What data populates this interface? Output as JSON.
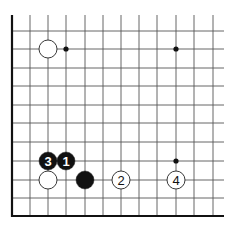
{
  "diagram": {
    "type": "go-board-fragment",
    "grid": {
      "columns_x": [
        12,
        30,
        48,
        66,
        85,
        103,
        121,
        139,
        157,
        176,
        194,
        213
      ],
      "rows_y": [
        31,
        49,
        68,
        86,
        105,
        123,
        142,
        161,
        180,
        198,
        216
      ],
      "top_y": 15,
      "right_x": 224,
      "left_edge_x": 12,
      "bottom_edge_y": 216,
      "line_color": "#555555",
      "edge_color": "#111111"
    },
    "star_points": [
      {
        "x": 66,
        "y": 49
      },
      {
        "x": 176,
        "y": 49
      },
      {
        "x": 176,
        "y": 161
      }
    ],
    "stones": [
      {
        "color": "white",
        "x": 48,
        "y": 49,
        "label": ""
      },
      {
        "color": "white",
        "x": 48,
        "y": 180,
        "label": ""
      },
      {
        "color": "black",
        "x": 85,
        "y": 180,
        "label": ""
      },
      {
        "color": "black",
        "x": 66,
        "y": 161,
        "label": "1"
      },
      {
        "color": "white",
        "x": 121,
        "y": 180,
        "label": "2"
      },
      {
        "color": "black",
        "x": 48,
        "y": 161,
        "label": "3"
      },
      {
        "color": "white",
        "x": 176,
        "y": 180,
        "label": "4"
      }
    ],
    "stone_radius": 9,
    "colors": {
      "black": "#111111",
      "white": "#ffffff",
      "stone_outline": "#222222"
    }
  }
}
